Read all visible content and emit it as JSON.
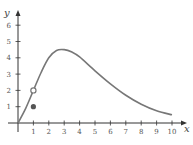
{
  "chart_data": {
    "type": "line",
    "title": "",
    "xlabel": "x",
    "ylabel": "y",
    "xlim": [
      0,
      10
    ],
    "ylim": [
      0,
      6
    ],
    "x_ticks": [
      1,
      2,
      3,
      4,
      5,
      6,
      7,
      8,
      9,
      10
    ],
    "y_ticks": [
      1,
      2,
      3,
      4,
      5,
      6
    ],
    "grid": false,
    "series": [
      {
        "name": "f(x)",
        "x": [
          0,
          0.5,
          1,
          1.5,
          2,
          2.5,
          3,
          3.5,
          4,
          5,
          6,
          7,
          8,
          9,
          10
        ],
        "y": [
          0,
          0.9,
          2.0,
          3.1,
          4.0,
          4.45,
          4.5,
          4.35,
          4.05,
          3.2,
          2.4,
          1.7,
          1.15,
          0.75,
          0.5
        ]
      }
    ],
    "points": [
      {
        "x": 1,
        "y": 2,
        "style": "open-circle"
      },
      {
        "x": 1,
        "y": 1,
        "style": "filled-dot"
      }
    ],
    "colors": {
      "curve": "#777777",
      "axis": "#333333",
      "filled_dot": "#555555"
    }
  },
  "axes": {
    "x_label": "x",
    "y_label": "y",
    "x_tick_labels": [
      "1",
      "2",
      "3",
      "4",
      "5",
      "6",
      "7",
      "8",
      "9",
      "10"
    ],
    "y_tick_labels": [
      "1",
      "2",
      "3",
      "4",
      "5",
      "6"
    ]
  }
}
